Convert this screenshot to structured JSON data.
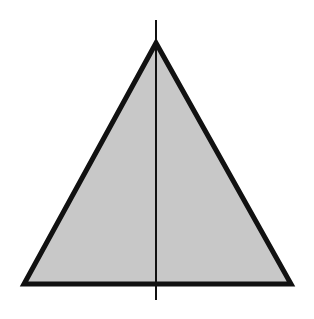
{
  "diagram": {
    "shape": "isosceles-triangle",
    "fill_color": "#c8c8c8",
    "stroke_color": "#111111",
    "axis_color": "#111111",
    "background_color": "#ffffff",
    "has_axis_of_symmetry": true
  }
}
